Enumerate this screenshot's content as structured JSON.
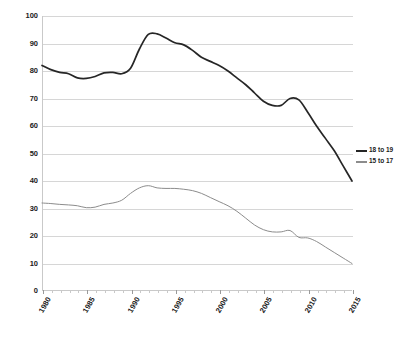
{
  "chart_data": {
    "type": "line",
    "title": "",
    "xlabel": "",
    "ylabel": "",
    "xlim": [
      1980,
      2015
    ],
    "ylim": [
      0,
      100
    ],
    "grid": true,
    "legend_position": "right",
    "x": [
      1980,
      1981,
      1982,
      1983,
      1984,
      1985,
      1986,
      1987,
      1988,
      1989,
      1990,
      1991,
      1992,
      1993,
      1994,
      1995,
      1996,
      1997,
      1998,
      1999,
      2000,
      2001,
      2002,
      2003,
      2004,
      2005,
      2006,
      2007,
      2008,
      2009,
      2010,
      2011,
      2012,
      2013,
      2014,
      2015
    ],
    "y_ticks": [
      0,
      10,
      20,
      30,
      40,
      50,
      60,
      70,
      80,
      90,
      100
    ],
    "x_tick_labels": [
      "1980",
      "1985",
      "1990",
      "1995",
      "2000",
      "2005",
      "2010",
      "2015"
    ],
    "x_tick_values": [
      1980,
      1985,
      1990,
      1995,
      2000,
      2005,
      2010,
      2015
    ],
    "series": [
      {
        "name": "18 to 19",
        "color": "#262626",
        "width": 1.7,
        "values": [
          82.0,
          80.5,
          79.5,
          79.0,
          77.5,
          77.3,
          78.0,
          79.3,
          79.5,
          79.0,
          81.0,
          88.0,
          93.3,
          93.5,
          92.0,
          90.3,
          89.5,
          87.5,
          85.0,
          83.5,
          82.0,
          80.0,
          77.5,
          75.0,
          72.0,
          69.0,
          67.5,
          67.5,
          70.0,
          69.5,
          65.0,
          60.0,
          55.5,
          51.0,
          45.5,
          40.0
        ]
      },
      {
        "name": "15 to 17",
        "color": "#8c8c8c",
        "width": 1.0,
        "values": [
          32.0,
          31.8,
          31.5,
          31.3,
          31.0,
          30.3,
          30.5,
          31.5,
          32.0,
          33.0,
          35.5,
          37.5,
          38.3,
          37.5,
          37.3,
          37.3,
          37.0,
          36.5,
          35.5,
          34.0,
          32.5,
          31.0,
          29.0,
          26.5,
          24.0,
          22.3,
          21.5,
          21.5,
          22.0,
          19.5,
          19.3,
          18.0,
          16.0,
          14.0,
          12.0,
          10.0
        ]
      }
    ]
  },
  "legend": {
    "items": [
      {
        "label": "18 to 19",
        "color": "#262626"
      },
      {
        "label": "15 to 17",
        "color": "#8c8c8c"
      }
    ]
  }
}
